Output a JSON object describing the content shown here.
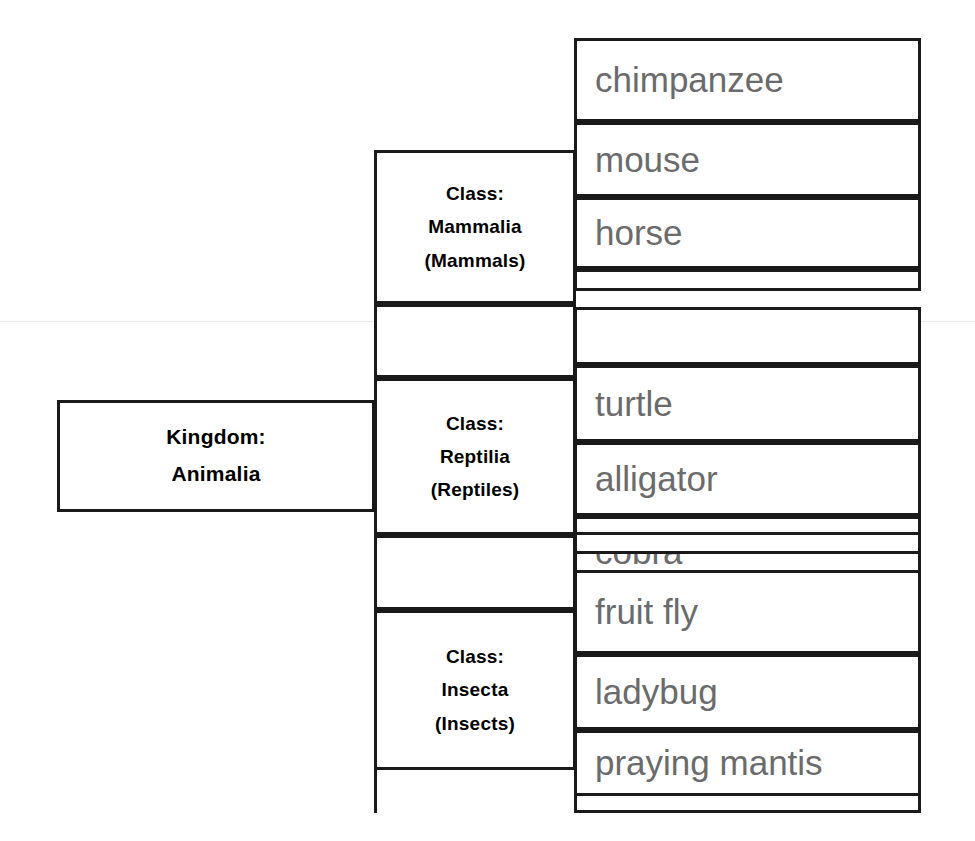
{
  "diagram": {
    "type": "hierarchy-tree",
    "text_color_primary": "#000000",
    "text_color_species": "#6b6b6b",
    "border_color": "#1a1a1a",
    "background": "#ffffff"
  },
  "root": {
    "label_line1": "Kingdom:",
    "label_line2": "Animalia"
  },
  "classes": [
    {
      "id": "mammalia",
      "label_line1": "Class:",
      "label_line2": "Mammalia",
      "label_line3": "(Mammals)",
      "species": [
        "chimpanzee",
        "mouse",
        "horse",
        ""
      ]
    },
    {
      "id": "reptilia",
      "label_line1": "Class:",
      "label_line2": "Reptilia",
      "label_line3": "(Reptiles)",
      "species": [
        "",
        "turtle",
        "alligator",
        "cobra",
        ""
      ]
    },
    {
      "id": "insecta",
      "label_line1": "Class:",
      "label_line2": "Insecta",
      "label_line3": "(Insects)",
      "species": [
        "fruit fly",
        "ladybug",
        "praying mantis",
        ""
      ]
    }
  ]
}
